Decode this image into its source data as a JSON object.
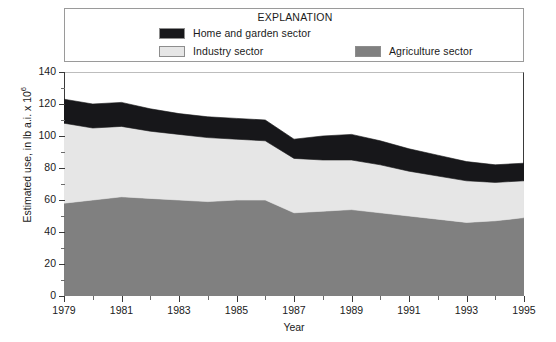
{
  "legend": {
    "title": "EXPLANATION",
    "entries": [
      {
        "label": "Home and garden sector",
        "color": "#17171a",
        "icon": "legend-swatch-dark"
      },
      {
        "label": "Industry sector",
        "color": "#e6e6e6",
        "icon": "legend-swatch-light"
      },
      {
        "label": "Agriculture sector",
        "color": "#808080",
        "icon": "legend-swatch-mid"
      }
    ]
  },
  "axes": {
    "y_title_main": "Estimated use, in lb a.i. x 10",
    "y_title_exponent": "6",
    "y_ticks": [
      "0",
      "20",
      "40",
      "60",
      "80",
      "100",
      "120",
      "140"
    ],
    "y_min": 0,
    "y_max": 140,
    "y_step": 20,
    "x_title": "Year",
    "x_ticks": [
      "1979",
      "1981",
      "1983",
      "1985",
      "1987",
      "1989",
      "1991",
      "1993",
      "1995"
    ],
    "x_min": 1979,
    "x_max": 1995,
    "x_step": 2
  },
  "chart_data": {
    "type": "area",
    "stacked": true,
    "title": "",
    "subtitle": "",
    "xlabel": "Year",
    "ylabel": "Estimated use, in lb a.i. x 10^6",
    "xlim": [
      1979,
      1995
    ],
    "ylim": [
      0,
      140
    ],
    "grid": false,
    "legend_position": "top",
    "legend_title": "EXPLANATION",
    "x": [
      1979,
      1980,
      1981,
      1982,
      1983,
      1984,
      1985,
      1986,
      1987,
      1988,
      1989,
      1990,
      1991,
      1992,
      1993,
      1994,
      1995
    ],
    "series": [
      {
        "name": "Agriculture sector",
        "color": "#808080",
        "values": [
          58,
          60,
          62,
          61,
          60,
          59,
          60,
          60,
          52,
          53,
          54,
          52,
          50,
          48,
          46,
          47,
          49
        ]
      },
      {
        "name": "Industry sector",
        "color": "#e6e6e6",
        "values": [
          50,
          45,
          44,
          42,
          41,
          40,
          38,
          37,
          34,
          32,
          31,
          30,
          28,
          27,
          26,
          24,
          23
        ]
      },
      {
        "name": "Home and garden sector",
        "color": "#17171a",
        "values": [
          15,
          15,
          15,
          14,
          13,
          13,
          13,
          13,
          12,
          15,
          16,
          15,
          14,
          13,
          12,
          11,
          11
        ]
      }
    ],
    "cumulative_totals": [
      123,
      120,
      121,
      117,
      114,
      112,
      111,
      110,
      98,
      100,
      101,
      97,
      92,
      88,
      84,
      82,
      83
    ]
  }
}
